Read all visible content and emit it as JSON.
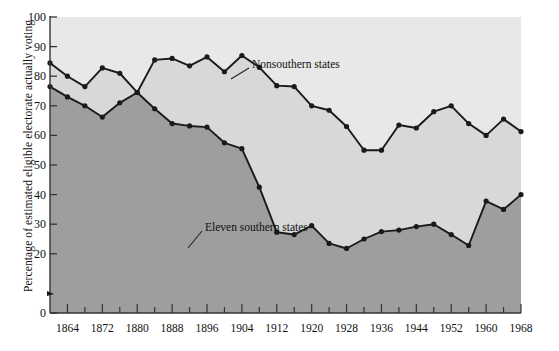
{
  "chart_data": {
    "type": "area",
    "title": "",
    "xlabel": "",
    "ylabel": "Percentage of estimated eligible electorate actually voting",
    "xlim": [
      1860,
      1968
    ],
    "ylim": [
      0,
      100
    ],
    "grid": false,
    "legend_position": "inline-annotation",
    "xticks": [
      "1864",
      "1872",
      "1880",
      "1888",
      "1896",
      "1904",
      "1912",
      "1920",
      "1928",
      "1936",
      "1944",
      "1952",
      "1960",
      "1968"
    ],
    "xtick_values": [
      1864,
      1872,
      1880,
      1888,
      1896,
      1904,
      1912,
      1920,
      1928,
      1936,
      1944,
      1952,
      1960,
      1968
    ],
    "yticks": [
      "0",
      "20",
      "30",
      "40",
      "50",
      "60",
      "70",
      "80",
      "90",
      "100"
    ],
    "ytick_values": [
      0,
      20,
      30,
      40,
      50,
      60,
      70,
      80,
      90,
      100
    ],
    "x": [
      1860,
      1864,
      1868,
      1872,
      1876,
      1880,
      1884,
      1888,
      1892,
      1896,
      1900,
      1904,
      1908,
      1912,
      1916,
      1920,
      1924,
      1928,
      1932,
      1936,
      1940,
      1944,
      1948,
      1952,
      1956,
      1960,
      1964,
      1968
    ],
    "series": [
      {
        "name": "Nonsouthern states",
        "fill_color": "#d8d8d8",
        "line_color": "#1a1a1a",
        "marker": "circle",
        "values": [
          84.5,
          80.0,
          76.5,
          82.8,
          81.0,
          74.5,
          85.5,
          86.0,
          83.5,
          86.5,
          81.5,
          87.0,
          83.0,
          76.8,
          76.5,
          70.0,
          68.5,
          63.0,
          55.0,
          55.0,
          63.5,
          62.5,
          68.0,
          70.0,
          64.0,
          60.0,
          65.5,
          61.3
        ]
      },
      {
        "name": "Eleven southern states",
        "fill_color": "#9e9e9e",
        "line_color": "#1a1a1a",
        "marker": "circle",
        "values": [
          76.5,
          73.0,
          70.0,
          66.2,
          71.0,
          74.5,
          69.0,
          64.0,
          63.2,
          62.8,
          57.5,
          55.5,
          42.5,
          27.3,
          26.5,
          29.5,
          23.5,
          21.8,
          25.0,
          27.5,
          28.0,
          29.2,
          30.0,
          26.5,
          22.8,
          37.8,
          35.0,
          40.0
        ]
      }
    ],
    "annotations": [
      {
        "text": "Nonsouthern states",
        "x": 252,
        "y": 65
      },
      {
        "text": "Eleven southern states",
        "x": 205,
        "y": 228
      }
    ]
  }
}
